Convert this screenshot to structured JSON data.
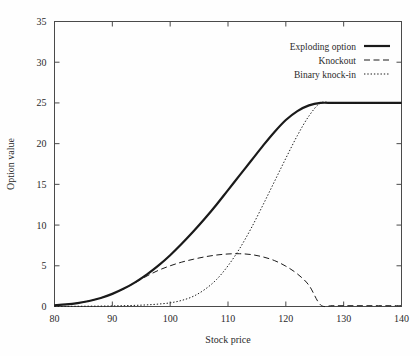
{
  "chart_data": {
    "type": "line",
    "title": "",
    "xlabel": "Stock price",
    "ylabel": "Option value",
    "xlim": [
      80,
      140
    ],
    "ylim": [
      0,
      35
    ],
    "xticks": [
      80,
      90,
      100,
      110,
      120,
      130,
      140
    ],
    "yticks": [
      0,
      5,
      10,
      15,
      20,
      25,
      30,
      35
    ],
    "grid": false,
    "legend_position": "top-right",
    "x": [
      80,
      82,
      84,
      86,
      88,
      90,
      92,
      94,
      96,
      98,
      100,
      102,
      104,
      106,
      108,
      110,
      112,
      114,
      116,
      118,
      120,
      122,
      124,
      126,
      128,
      130,
      132,
      134,
      136,
      138,
      140
    ],
    "series": [
      {
        "name": "Exploding option",
        "style": "solid",
        "linewidth": 2.2,
        "values": [
          0.15,
          0.25,
          0.42,
          0.68,
          1.05,
          1.55,
          2.2,
          3.0,
          3.95,
          5.05,
          6.3,
          7.7,
          9.2,
          10.8,
          12.5,
          14.3,
          16.1,
          17.9,
          19.7,
          21.4,
          22.9,
          24.0,
          24.7,
          25.0,
          25.0,
          25.0,
          25.0,
          25.0,
          25.0,
          25.0,
          25.0
        ]
      },
      {
        "name": "Knockout",
        "style": "dashed",
        "linewidth": 1.0,
        "values": [
          0.15,
          0.25,
          0.42,
          0.68,
          1.05,
          1.55,
          2.2,
          2.95,
          3.75,
          4.45,
          5.0,
          5.45,
          5.8,
          6.1,
          6.32,
          6.45,
          6.48,
          6.38,
          6.1,
          5.65,
          4.95,
          4.0,
          2.6,
          0.2,
          0.1,
          0.1,
          0.1,
          0.1,
          0.1,
          0.1,
          0.1
        ]
      },
      {
        "name": "Binary knock-in",
        "style": "dotted",
        "linewidth": 1.0,
        "values": [
          0.02,
          0.02,
          0.03,
          0.04,
          0.05,
          0.07,
          0.1,
          0.14,
          0.2,
          0.3,
          0.45,
          0.75,
          1.25,
          2.1,
          3.3,
          5.0,
          7.1,
          9.6,
          12.4,
          15.3,
          18.2,
          21.0,
          23.4,
          25.0,
          25.0,
          25.0,
          25.0,
          25.0,
          25.0,
          25.0,
          25.0
        ]
      }
    ]
  },
  "legend": {
    "entries": [
      {
        "label": "Exploding option",
        "style": "solid"
      },
      {
        "label": "Knockout",
        "style": "dashed"
      },
      {
        "label": "Binary knock-in",
        "style": "dotted"
      }
    ]
  },
  "colors": {
    "line": "#1a1a1a",
    "axis": "#4a4a4a",
    "text": "#2a2a2a",
    "background": "#fefefe"
  }
}
